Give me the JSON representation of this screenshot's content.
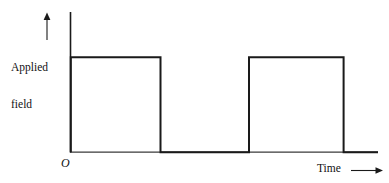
{
  "figure": {
    "background_color": "#ffffff",
    "line_color": "#1a1a1a",
    "text_color": "#111111"
  },
  "labels": {
    "y_axis_line1": "Applied",
    "y_axis_line2": "field",
    "origin": "O",
    "x_axis": "Time"
  },
  "icons": {
    "y_axis_arrow": "arrow-up-icon",
    "x_axis_arrow": "arrow-right-icon"
  },
  "chart_data": {
    "type": "line",
    "title": "",
    "xlabel": "Time",
    "ylabel": "Applied field",
    "grid": false,
    "legend": null,
    "axis_arrows": {
      "x": "right",
      "y": "up"
    },
    "origin_label": "O",
    "tick_labels": {
      "x": [],
      "y": []
    },
    "xlim": [
      0,
      1
    ],
    "ylim": [
      0,
      1.15
    ],
    "series": [
      {
        "name": "Applied field",
        "waveform": "square-pulse-train",
        "high_level": 1,
        "low_level": 0,
        "pulses": [
          {
            "start": 0.0,
            "end": 0.292
          },
          {
            "start": 0.58,
            "end": 0.888
          }
        ],
        "x": [
          0.0,
          0.0,
          0.292,
          0.292,
          0.58,
          0.58,
          0.888,
          0.888,
          1.0
        ],
        "y": [
          0,
          1,
          1,
          0,
          0,
          1,
          1,
          0,
          0
        ]
      }
    ]
  }
}
